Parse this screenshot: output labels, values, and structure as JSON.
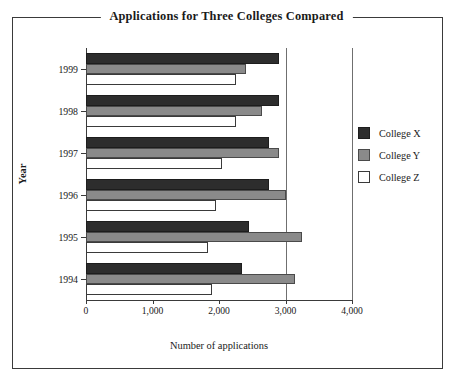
{
  "top_bleed_text": "",
  "figure": {
    "title": "Applications for Three Colleges Compared"
  },
  "legend": {
    "position": "right",
    "entries": [
      {
        "label": "College X",
        "color": "#2d2d2d"
      },
      {
        "label": "College Y",
        "color": "#8a8a8a"
      },
      {
        "label": "College Z",
        "color": "#ffffff"
      }
    ]
  },
  "chart_data": {
    "type": "bar",
    "orientation": "horizontal",
    "title": "Applications for Three Colleges Compared",
    "xlabel": "Number of applications",
    "ylabel": "Year",
    "categories": [
      "1994",
      "1995",
      "1996",
      "1997",
      "1998",
      "1999"
    ],
    "category_order_top_to_bottom": [
      "1999",
      "1998",
      "1997",
      "1996",
      "1995",
      "1994"
    ],
    "series": [
      {
        "name": "College X",
        "color": "#2d2d2d",
        "values": [
          2350,
          2450,
          2750,
          2750,
          2900,
          2900
        ]
      },
      {
        "name": "College Y",
        "color": "#8a8a8a",
        "values": [
          3150,
          3250,
          3000,
          2900,
          2650,
          2400
        ]
      },
      {
        "name": "College Z",
        "color": "#ffffff",
        "values": [
          1900,
          1830,
          1950,
          2050,
          2250,
          2250
        ]
      }
    ],
    "xlim": [
      0,
      4000
    ],
    "xticks": [
      0,
      1000,
      2000,
      3000,
      4000
    ],
    "xtick_labels": [
      "0",
      "1,000",
      "2,000",
      "3,000",
      "4,000"
    ],
    "grid": true,
    "gridlines_at": [
      3000,
      4000
    ],
    "legend_position": "right"
  }
}
